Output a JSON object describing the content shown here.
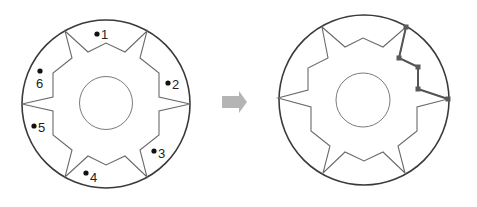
{
  "diagram": {
    "left_figure": {
      "outer_circle": {
        "cx": 106,
        "cy": 104,
        "r": 84
      },
      "inner_circle": {
        "cx": 106,
        "cy": 103,
        "r": 26.5
      },
      "star_points": "65,31 88,52 106,43 125,52 147,31 140,58 159,73 159,97 190,104 159,111 159,135 140,150 147,177 125,156 106,165 88,156 65,177 72,150 53,135 53,111 22,104 53,97 53,73 72,58",
      "labels": [
        {
          "text": "1",
          "dot_x": 97,
          "dot_y": 34,
          "text_x": 101,
          "text_y": 39
        },
        {
          "text": "2",
          "dot_x": 168,
          "dot_y": 83,
          "text_x": 172,
          "text_y": 89
        },
        {
          "text": "3",
          "dot_x": 154,
          "dot_y": 151,
          "text_x": 158,
          "text_y": 158
        },
        {
          "text": "4",
          "dot_x": 86,
          "dot_y": 173,
          "text_x": 90,
          "text_y": 182
        },
        {
          "text": "5",
          "dot_x": 34,
          "dot_y": 126,
          "text_x": 38,
          "text_y": 132
        },
        {
          "text": "6",
          "dot_x": 40,
          "dot_y": 71,
          "text_x": 36,
          "text_y": 88
        }
      ]
    },
    "arrow": {
      "color": "#b4b4b4",
      "direction": "right"
    },
    "right_figure": {
      "outer_circle": {
        "cx": 364,
        "cy": 100,
        "r": 85
      },
      "inner_circle": {
        "cx": 363,
        "cy": 100,
        "r": 27
      },
      "star_points": "322,27 345,47 363,38 383,47 406,27 399,58 418,67 418,89 448,99 417,107 417,131 398,146 405,173 383,152 364,161 345,152 323,173 330,146 311,131 311,107 278,98 308,90 308,68 328,58",
      "selected_segment_points": "406,27 399,58 418,67 418,89 448,99",
      "handles": [
        {
          "x": 406,
          "y": 27
        },
        {
          "x": 399,
          "y": 58
        },
        {
          "x": 418,
          "y": 67
        },
        {
          "x": 418,
          "y": 89
        },
        {
          "x": 448,
          "y": 99
        }
      ]
    }
  }
}
